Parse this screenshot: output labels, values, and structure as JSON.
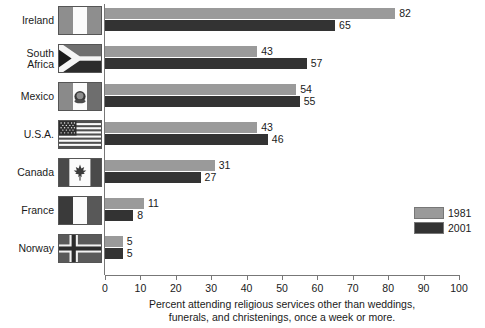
{
  "chart_data": {
    "type": "bar",
    "orientation": "horizontal",
    "title": "",
    "xlabel_line1": "Percent attending religious services other than weddings,",
    "xlabel_line2": "funerals, and christenings, once a week or more.",
    "ylabel": "",
    "xlim": [
      0,
      100
    ],
    "xticks": [
      0,
      10,
      20,
      30,
      40,
      50,
      60,
      70,
      80,
      90,
      100
    ],
    "grid": false,
    "legend_position": "right",
    "categories": [
      "Ireland",
      "South\nAfrica",
      "Mexico",
      "U.S.A.",
      "Canada",
      "France",
      "Norway"
    ],
    "series": [
      {
        "name": "1981",
        "color": "#9a9a9a",
        "values": [
          82,
          43,
          54,
          43,
          31,
          11,
          5
        ]
      },
      {
        "name": "2001",
        "color": "#333333",
        "values": [
          65,
          57,
          55,
          46,
          27,
          8,
          5
        ]
      }
    ]
  },
  "rows": [
    {
      "country": "Ireland",
      "flag": "ireland-flag",
      "v1981": 82,
      "v2001": 65
    },
    {
      "country": "South\nAfrica",
      "flag": "south-africa-flag",
      "v1981": 43,
      "v2001": 57
    },
    {
      "country": "Mexico",
      "flag": "mexico-flag",
      "v1981": 54,
      "v2001": 55
    },
    {
      "country": "U.S.A.",
      "flag": "usa-flag",
      "v1981": 43,
      "v2001": 46
    },
    {
      "country": "Canada",
      "flag": "canada-flag",
      "v1981": 31,
      "v2001": 27
    },
    {
      "country": "France",
      "flag": "france-flag",
      "v1981": 11,
      "v2001": 8
    },
    {
      "country": "Norway",
      "flag": "norway-flag",
      "v1981": 5,
      "v2001": 5
    }
  ],
  "axis": {
    "ticks": [
      "0",
      "10",
      "20",
      "30",
      "40",
      "50",
      "60",
      "70",
      "80",
      "90",
      "100"
    ],
    "caption_line1": "Percent attending religious services other than weddings,",
    "caption_line2": "funerals, and christenings, once a week or more."
  },
  "legend": {
    "items": [
      {
        "label": "1981",
        "color": "#9a9a9a"
      },
      {
        "label": "2001",
        "color": "#333333"
      }
    ]
  },
  "colors": {
    "series_1981": "#9a9a9a",
    "series_2001": "#333333",
    "axis": "#777777",
    "text": "#1a1a1a",
    "background": "#ffffff"
  }
}
